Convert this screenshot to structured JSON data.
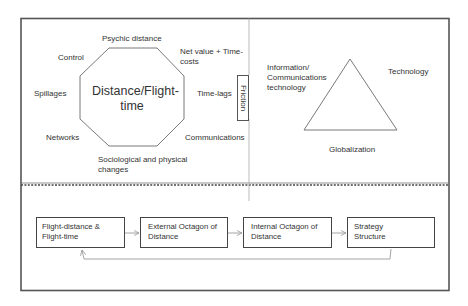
{
  "colors": {
    "frame": "#555555",
    "shape_stroke": "#6a6a6a",
    "arrow": "#9a9a9a",
    "text": "#333333",
    "background": "#ffffff"
  },
  "top_left_panel": {
    "center_label": "Distance/Flight-time",
    "octagon_labels": {
      "top": "Psychic distance",
      "top_right": "Net value + Time-costs",
      "right": "Time-lags",
      "bottom_right": "Communications",
      "bottom": "Sociological and physical changes",
      "bottom_left": "Networks",
      "left": "Spillages",
      "top_left": "Control"
    }
  },
  "friction_box": {
    "label": "Friction"
  },
  "top_right_panel": {
    "triangle_labels": {
      "left": "Information/ Communications technology",
      "right": "Technology",
      "bottom": "Globalization"
    }
  },
  "flow": {
    "boxes": [
      {
        "label": "Flight-distance & Flight-time"
      },
      {
        "label": "External Octagon of Distance"
      },
      {
        "label": "Internal Octagon of Distance"
      },
      {
        "label": "Strategy Structure"
      }
    ],
    "feedback": {
      "from": "Strategy Structure",
      "to": "Flight-distance & Flight-time"
    }
  }
}
